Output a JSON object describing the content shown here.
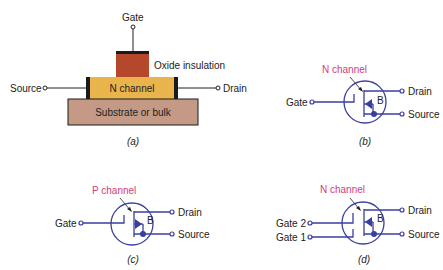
{
  "colors": {
    "symbol_blue": "#3a3f9e",
    "channel_label_pink": "#d23c7a",
    "oxide": "#b5472a",
    "n_channel": "#e9b44c",
    "substrate": "#c49a86",
    "edge": "#1a1a1a"
  },
  "panel_a": {
    "caption": "(a)",
    "gate_label": "Gate",
    "oxide_label": "Oxide insulation",
    "source_label": "Source",
    "drain_label": "Drain",
    "channel_label": "N channel",
    "substrate_label": "Substrate or bulk"
  },
  "panel_b": {
    "caption": "(b)",
    "channel_type": "N channel",
    "gate_label": "Gate",
    "drain_label": "Drain",
    "source_label": "Source",
    "body_label": "B",
    "arrow_direction": "inward"
  },
  "panel_c": {
    "caption": "(c)",
    "channel_type": "P channel",
    "gate_label": "Gate",
    "drain_label": "Drain",
    "source_label": "Source",
    "body_label": "B",
    "arrow_direction": "outward"
  },
  "panel_d": {
    "caption": "(d)",
    "channel_type": "N channel",
    "gate2_label": "Gate 2",
    "gate1_label": "Gate 1",
    "drain_label": "Drain",
    "source_label": "Source",
    "body_label": "B",
    "arrow_direction": "inward"
  }
}
